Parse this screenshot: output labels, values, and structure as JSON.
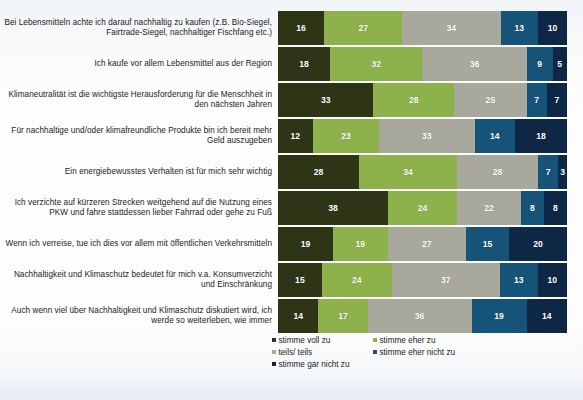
{
  "chart_data": {
    "type": "bar",
    "orientation": "horizontal",
    "stacked": true,
    "stack_total": 100,
    "units": "percent",
    "title": "",
    "subtitle": "",
    "xlabel": "",
    "ylabel": "",
    "xlim": [
      0,
      100
    ],
    "grid": false,
    "legend_position": "bottom",
    "categories": [
      "Bei Lebensmitteln achte ich darauf nachhaltig zu kaufen (z.B. Bio-Siegel, Fairtrade-Siegel, nachhaltiger Fischfang etc.)",
      "Ich kaufe vor allem Lebensmittel aus der Region",
      "Klimaneutralität ist die wichtigste Herausforderung für die Menschheit in den nächsten Jahren",
      "Für nachhaltige und/oder klimafreundliche Produkte bin ich bereit mehr Geld auszugeben",
      "Ein energiebewusstes Verhalten ist für mich sehr wichtig",
      "Ich verzichte auf kürzeren Strecken weitgehend auf die Nutzung eines PKW und fahre stattdessen lieber Fahrrad oder gehe zu Fuß",
      "Wenn ich verreise, tue ich dies vor allem mit öffentlichen Verkehrsmitteln",
      "Nachhaltigkeit und Klimaschutz bedeutet für mich v.a. Konsumverzicht und Einschränkung",
      "Auch wenn viel über Nachhaltigkeit und Klimaschutz diskutiert wird, ich werde so weiterleben, wie immer"
    ],
    "series": [
      {
        "name": "stimme voll zu",
        "color": "#2e3416",
        "values": [
          16,
          18,
          33,
          12,
          28,
          38,
          19,
          15,
          14
        ]
      },
      {
        "name": "stimme eher zu",
        "color": "#8db14b",
        "values": [
          27,
          32,
          28,
          23,
          34,
          24,
          19,
          24,
          17
        ]
      },
      {
        "name": "teils/ teils",
        "color": "#a9a89d",
        "values": [
          34,
          36,
          25,
          33,
          28,
          22,
          27,
          37,
          36
        ]
      },
      {
        "name": "stimme eher nicht zu",
        "color": "#155379",
        "values": [
          13,
          9,
          7,
          14,
          7,
          8,
          15,
          13,
          19
        ]
      },
      {
        "name": "stimme gar nicht zu",
        "color": "#0d2744",
        "values": [
          10,
          5,
          7,
          18,
          3,
          8,
          20,
          10,
          14
        ]
      }
    ]
  },
  "rows": [
    {
      "label": "Bei Lebensmitteln achte ich darauf nachhaltig zu kaufen (z.B. Bio-Siegel, Fairtrade-Siegel, nachhaltiger Fischfang etc.)",
      "values": [
        16,
        27,
        34,
        13,
        10
      ]
    },
    {
      "label": "Ich kaufe vor allem Lebensmittel aus der Region",
      "values": [
        18,
        32,
        36,
        9,
        5
      ]
    },
    {
      "label": "Klimaneutralität ist die wichtigste Herausforderung für die Menschheit in den nächsten Jahren",
      "values": [
        33,
        28,
        25,
        7,
        7
      ]
    },
    {
      "label": "Für nachhaltige und/oder klimafreundliche Produkte bin ich bereit mehr Geld auszugeben",
      "values": [
        12,
        23,
        33,
        14,
        18
      ]
    },
    {
      "label": "Ein energiebewusstes Verhalten ist für mich sehr wichtig",
      "values": [
        28,
        34,
        28,
        7,
        3
      ]
    },
    {
      "label": "Ich verzichte auf kürzeren Strecken weitgehend auf die Nutzung eines PKW und fahre stattdessen lieber Fahrrad oder gehe zu Fuß",
      "values": [
        38,
        24,
        22,
        8,
        8
      ]
    },
    {
      "label": "Wenn ich verreise, tue ich dies vor allem mit öffentlichen Verkehrsmitteln",
      "values": [
        19,
        19,
        27,
        15,
        20
      ]
    },
    {
      "label": "Nachhaltigkeit und Klimaschutz bedeutet für mich v.a. Konsumverzicht und Einschränkung",
      "values": [
        15,
        24,
        37,
        13,
        10
      ]
    },
    {
      "label": "Auch wenn viel über Nachhaltigkeit und Klimaschutz diskutiert wird, ich werde so weiterleben, wie immer",
      "values": [
        14,
        17,
        36,
        19,
        14
      ]
    }
  ],
  "legend": {
    "items": [
      {
        "label": "stimme voll zu",
        "color": "#2e3416"
      },
      {
        "label": "stimme eher zu",
        "color": "#8db14b"
      },
      {
        "label": "teils/ teils",
        "color": "#a9a89d"
      },
      {
        "label": "stimme eher nicht zu",
        "color": "#155379"
      },
      {
        "label": "stimme gar nicht zu",
        "color": "#0d2744"
      }
    ]
  }
}
